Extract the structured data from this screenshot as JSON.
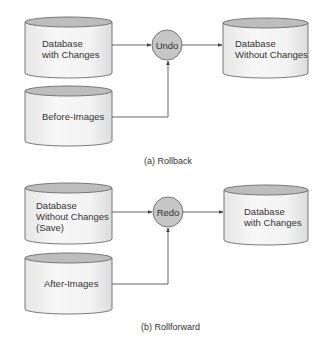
{
  "colors": {
    "background": "#ffffff",
    "cylinder_top": "#bdbdbd",
    "cylinder_body": "#f2f2f2",
    "process_fill": "#c6c6c6",
    "outline": "#6a6a6a",
    "text": "#333333"
  },
  "rollback": {
    "caption": "(a) Rollback",
    "source_db": {
      "line1": "Database",
      "line2": "with Changes"
    },
    "log_db": {
      "label": "Before-Images"
    },
    "process": {
      "label": "Undo"
    },
    "target_db": {
      "line1": "Database",
      "line2": "Without Changes"
    }
  },
  "rollforward": {
    "caption": "(b) Rollforward",
    "source_db": {
      "line1": "Database",
      "line2": "Without Changes",
      "line3": "(Save)"
    },
    "log_db": {
      "label": "After-Images"
    },
    "process": {
      "label": "Redo"
    },
    "target_db": {
      "line1": "Database",
      "line2": "with Changes"
    }
  }
}
